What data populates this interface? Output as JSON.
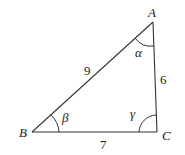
{
  "diagram": {
    "type": "triangle",
    "vertices": {
      "A": {
        "label": "A",
        "x": 153,
        "y": 22
      },
      "B": {
        "label": "B",
        "x": 32,
        "y": 132
      },
      "C": {
        "label": "C",
        "x": 157,
        "y": 132
      }
    },
    "sides": {
      "AB": {
        "label": "9"
      },
      "AC": {
        "label": "6"
      },
      "BC": {
        "label": "7"
      }
    },
    "angles": {
      "A": {
        "label": "α"
      },
      "B": {
        "label": "β"
      },
      "C": {
        "label": "γ"
      }
    },
    "colors": {
      "stroke": "#333333",
      "text": "#222222",
      "background": "#ffffff"
    }
  }
}
